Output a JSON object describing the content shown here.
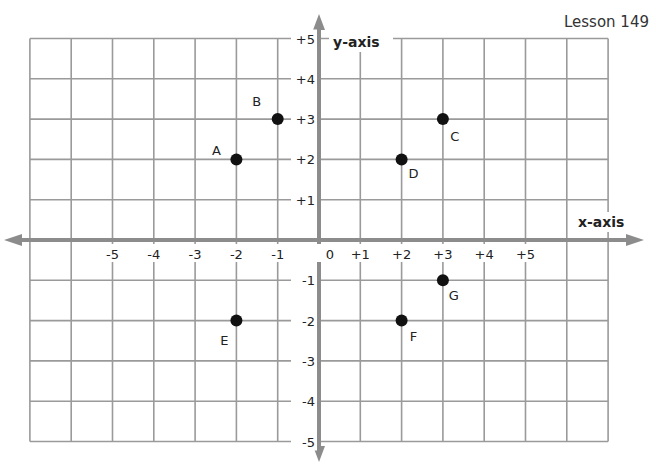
{
  "header": {
    "lesson": "Lesson 149"
  },
  "colors": {
    "grid": "#9a9a9a",
    "axis": "#8c8c8c",
    "point": "#111111",
    "background": "#ffffff"
  },
  "chart_data": {
    "type": "scatter",
    "title": "",
    "xlabel": "x-axis",
    "ylabel": "y-axis",
    "xlim": [
      -7,
      7
    ],
    "ylim": [
      -5,
      5
    ],
    "grid": true,
    "x_tick_labels": [
      "-5",
      "-4",
      "-3",
      "-2",
      "-1",
      "0",
      "+1",
      "+2",
      "+3",
      "+4",
      "+5"
    ],
    "y_tick_labels": [
      "+5",
      "+4",
      "+3",
      "+2",
      "+1",
      "-1",
      "-2",
      "-3",
      "-4",
      "-5"
    ],
    "points": [
      {
        "label": "A",
        "x": -2,
        "y": 2
      },
      {
        "label": "B",
        "x": -1,
        "y": 3
      },
      {
        "label": "C",
        "x": 3,
        "y": 3
      },
      {
        "label": "D",
        "x": 2,
        "y": 2
      },
      {
        "label": "E",
        "x": -2,
        "y": -2
      },
      {
        "label": "F",
        "x": 2,
        "y": -2
      },
      {
        "label": "G",
        "x": 3,
        "y": -1
      }
    ]
  }
}
